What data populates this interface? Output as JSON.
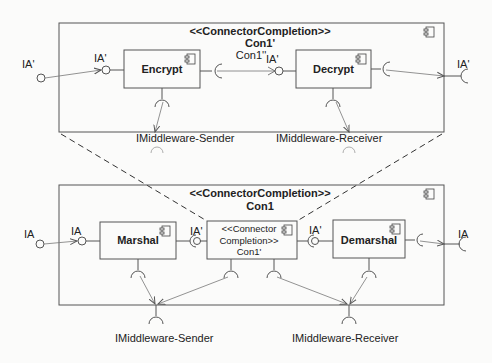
{
  "diagram_type": "UML component diagram",
  "upper_composite": {
    "stereotype": "<<ConnectorCompletion>>",
    "name": "Con1'",
    "sub_name": "Con1''",
    "components": [
      {
        "name": "Encrypt"
      },
      {
        "name": "Decrypt"
      }
    ],
    "ports": {
      "outer_left": "IA'",
      "encrypt_in": "IA'",
      "decrypt_in": "IA'",
      "outer_right": "IA'"
    },
    "required_interfaces": [
      "IMiddleware-Sender",
      "IMiddleware-Receiver"
    ]
  },
  "lower_composite": {
    "stereotype": "<<ConnectorCompletion>>",
    "name": "Con1",
    "components": [
      {
        "name": "Marshal"
      },
      {
        "name": "<<Connector Completion>> Con1'",
        "line1": "<<Connector",
        "line2": "Completion>>",
        "line3": "Con1'"
      },
      {
        "name": "Demarshal"
      }
    ],
    "ports": {
      "outer_left": "IA",
      "marshal_in": "IA",
      "connector_in": "IA'",
      "demarshal_in": "IA'",
      "outer_right": "IA"
    },
    "required_interfaces": [
      "IMiddleware-Sender",
      "IMiddleware-Receiver"
    ]
  }
}
